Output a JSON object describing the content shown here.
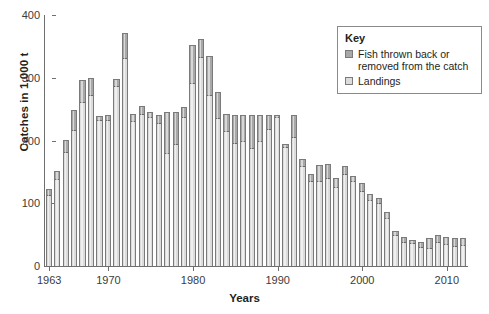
{
  "chart_data": {
    "type": "bar",
    "stacked": true,
    "title": "",
    "xlabel": "Years",
    "ylabel": "Catches in 1,000 t",
    "ylim": [
      0,
      400
    ],
    "yticks": [
      0,
      100,
      200,
      300,
      400
    ],
    "xticks": [
      "1963",
      "1970",
      "1980",
      "1990",
      "2000",
      "2010"
    ],
    "grid": false,
    "legend_position": "top-right",
    "categories": [
      "1963",
      "1964",
      "1965",
      "1966",
      "1967",
      "1968",
      "1969",
      "1970",
      "1971",
      "1972",
      "1973",
      "1974",
      "1975",
      "1976",
      "1977",
      "1978",
      "1979",
      "1980",
      "1981",
      "1982",
      "1983",
      "1984",
      "1985",
      "1986",
      "1987",
      "1988",
      "1989",
      "1990",
      "1991",
      "1992",
      "1993",
      "1994",
      "1995",
      "1996",
      "1997",
      "1998",
      "1999",
      "2000",
      "2001",
      "2002",
      "2003",
      "2004",
      "2005",
      "2006",
      "2007",
      "2008",
      "2009",
      "2010",
      "2011",
      "2012"
    ],
    "series": [
      {
        "name": "Landings",
        "color": "#dcdcdc",
        "values": [
          113,
          139,
          181,
          216,
          262,
          272,
          232,
          233,
          287,
          332,
          231,
          243,
          238,
          228,
          180,
          194,
          238,
          291,
          333,
          272,
          236,
          215,
          196,
          199,
          188,
          200,
          218,
          237,
          190,
          205,
          160,
          135,
          136,
          140,
          126,
          147,
          135,
          120,
          105,
          100,
          76,
          49,
          38,
          36,
          31,
          28,
          38,
          35,
          32,
          33
        ]
      },
      {
        "name": "Fish thrown back or removed from the catch",
        "color": "#a8a8a8",
        "values": [
          9,
          12,
          20,
          32,
          35,
          27,
          7,
          7,
          11,
          39,
          11,
          12,
          8,
          13,
          65,
          51,
          15,
          61,
          29,
          62,
          41,
          28,
          45,
          42,
          53,
          40,
          23,
          3,
          4,
          36,
          11,
          11,
          25,
          22,
          14,
          13,
          8,
          12,
          10,
          9,
          10,
          7,
          9,
          5,
          7,
          16,
          11,
          12,
          13,
          11
        ]
      }
    ],
    "totals": [
      122,
      151,
      201,
      248,
      297,
      299,
      239,
      240,
      298,
      371,
      242,
      255,
      246,
      241,
      245,
      245,
      253,
      352,
      362,
      334,
      277,
      243,
      241,
      241,
      241,
      240,
      241,
      240,
      194,
      241,
      171,
      146,
      161,
      162,
      140,
      160,
      143,
      132,
      115,
      109,
      86,
      56,
      47,
      41,
      38,
      44,
      49,
      47,
      45,
      44
    ]
  },
  "legend": {
    "title": "Key",
    "items": [
      {
        "label": "Fish thrown back or removed from the catch",
        "swatch": "discard-swatch"
      },
      {
        "label": "Landings",
        "swatch": "landings-swatch"
      }
    ]
  }
}
